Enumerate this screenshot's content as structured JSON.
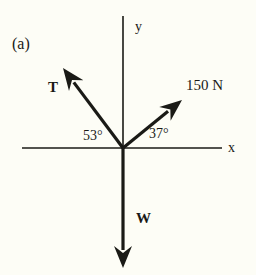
{
  "figure": {
    "panel_label": "(a)",
    "background_color": "#fdfdf6",
    "ink_color": "#1a1a16",
    "width": 256,
    "height": 275
  },
  "axes": {
    "x_label": "x",
    "y_label": "y",
    "origin": {
      "x": 123,
      "y": 148
    },
    "x_axis": {
      "x1": 22,
      "y1": 148,
      "x2": 222,
      "y2": 148
    },
    "y_axis": {
      "x1": 123,
      "y1": 16,
      "x2": 123,
      "y2": 148
    },
    "axis_stroke_width": 1.6
  },
  "vectors": [
    {
      "name": "tension",
      "label": "T",
      "label_style": "bold",
      "label_x": 48,
      "label_y": 80,
      "tail": {
        "x": 123,
        "y": 148
      },
      "tip": {
        "x": 63,
        "y": 68
      },
      "angle_from_x_axis_deg": 127,
      "stroke_width": 3.2
    },
    {
      "name": "applied-force-150N",
      "label": "150 N",
      "label_style": "plain",
      "label_x": 186,
      "label_y": 78,
      "tail": {
        "x": 123,
        "y": 148
      },
      "tip": {
        "x": 182,
        "y": 100
      },
      "angle_from_x_axis_deg": 37,
      "stroke_width": 3.2
    },
    {
      "name": "weight",
      "label": "W",
      "label_style": "bold",
      "label_x": 136,
      "label_y": 211,
      "tail": {
        "x": 123,
        "y": 148
      },
      "tip": {
        "x": 123,
        "y": 268
      },
      "angle_from_x_axis_deg": 270,
      "stroke_width": 3.2
    }
  ],
  "angles": [
    {
      "name": "angle-left",
      "text": "53°",
      "x": 83,
      "y": 129,
      "between": "T and -x axis region (measured from +y axis)"
    },
    {
      "name": "angle-right",
      "text": "37°",
      "x": 149,
      "y": 127,
      "between": "150 N vector and +x axis"
    }
  ]
}
